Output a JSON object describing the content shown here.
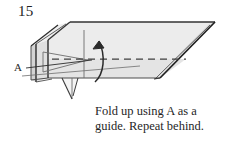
{
  "diagram": {
    "step_number": "15",
    "point_label": "A",
    "caption_line_1": "Fold up using A as a",
    "caption_line_2": "guide. Repeat behind.",
    "colors": {
      "paper_fill": "#e9e9e9",
      "paper_fill_light": "#f2f2f2",
      "outline": "#2b2b2b",
      "crease": "#6d6d6d",
      "dashed_fold": "#4a4a4a",
      "background": "#ffffff",
      "text": "#1f1f1f"
    },
    "icons": {
      "fold_arrow": "curved-up-arrow-icon",
      "valley_fold": "dashed-fold-line-icon",
      "leader": "label-leader-line-icon"
    }
  }
}
